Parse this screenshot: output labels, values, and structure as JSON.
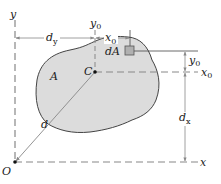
{
  "diagram": {
    "colors": {
      "area_fill": "#dcdcdc",
      "outline": "#444444",
      "dashed": "#888888",
      "dimension": "#888888",
      "element_fill": "#b0b0b0",
      "text": "#222222"
    },
    "labels": {
      "y_axis": "y",
      "x_axis": "x",
      "origin": "O",
      "centroid": "C",
      "area": "A",
      "element": "dA",
      "distance": "d",
      "dy_main": "d",
      "dy_sub": "y",
      "dx_main": "d",
      "dx_sub": "x",
      "y0_main": "y",
      "y0_sub": "0",
      "x0_main": "x",
      "x0_sub": "0",
      "y0_dim_main": "y",
      "y0_dim_sub": "0",
      "x0_dim_main": "x",
      "x0_dim_sub": "0"
    }
  }
}
